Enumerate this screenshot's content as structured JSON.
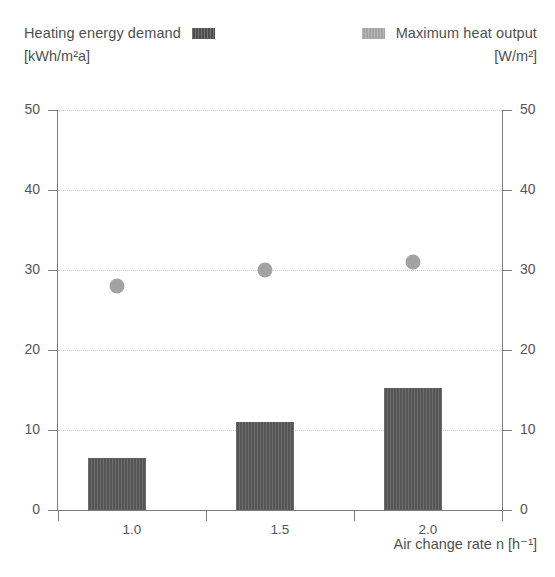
{
  "legend": {
    "left": {
      "label": "Heating energy demand",
      "unit": "[kWh/m²a]",
      "swatch_name": "heating-energy-demand-swatch",
      "color": "#565656"
    },
    "right": {
      "label": "Maximum heat output",
      "unit": "[W/m²]",
      "swatch_name": "maximum-heat-output-swatch",
      "color": "#a3a3a3"
    }
  },
  "axes": {
    "x_title": "Air change rate n [h⁻¹]",
    "x_ticklabels": [
      "1.0",
      "1.5",
      "2.0"
    ],
    "y_left_ticklabels": [
      "0",
      "10",
      "20",
      "30",
      "40",
      "50"
    ],
    "y_right_ticklabels": [
      "0",
      "10",
      "20",
      "30",
      "40",
      "50"
    ]
  },
  "chart_data": {
    "type": "bar",
    "title": "",
    "xlabel": "Air change rate n [h⁻¹]",
    "ylabel": "Heating energy demand [kWh/m²a]",
    "y2label": "Maximum heat output [W/m²]",
    "categories": [
      "1.0",
      "1.5",
      "2.0"
    ],
    "ylim": [
      0,
      50
    ],
    "y2lim": [
      0,
      50
    ],
    "yticks": [
      0,
      10,
      20,
      30,
      40,
      50
    ],
    "grid": "horizontal-dotted",
    "legend_position": "top",
    "series": [
      {
        "name": "Heating energy demand",
        "unit": "kWh/m²a",
        "type": "bar",
        "axis": "left",
        "color": "#565656",
        "values": [
          6.5,
          11.0,
          15.3
        ]
      },
      {
        "name": "Maximum heat output",
        "unit": "W/m²",
        "type": "scatter",
        "axis": "right",
        "color": "#a3a3a3",
        "values": [
          29.0,
          31.0,
          32.0
        ]
      }
    ]
  }
}
